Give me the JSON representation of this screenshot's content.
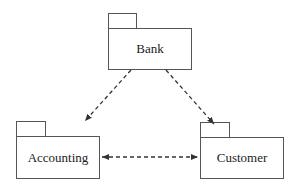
{
  "diagram": {
    "type": "UML package diagram",
    "packages": [
      {
        "id": "bank",
        "label": "Bank"
      },
      {
        "id": "accounting",
        "label": "Accounting"
      },
      {
        "id": "customer",
        "label": "Customer"
      }
    ],
    "dependencies": [
      {
        "from": "Bank",
        "to": "Accounting",
        "style": "dashed",
        "arrow": "single"
      },
      {
        "from": "Bank",
        "to": "Customer",
        "style": "dashed",
        "arrow": "single"
      },
      {
        "from": "Accounting",
        "to": "Customer",
        "style": "dashed",
        "arrow": "bidirectional"
      }
    ],
    "colors": {
      "line": "#333333",
      "background": "#ffffff"
    }
  }
}
